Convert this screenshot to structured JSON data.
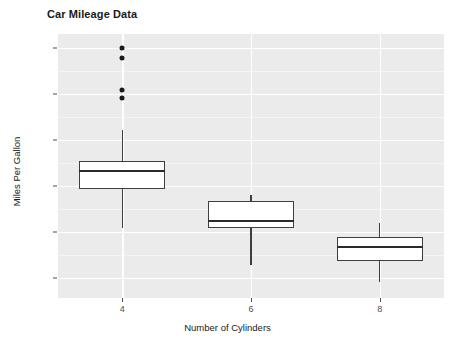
{
  "chart_data": {
    "type": "box",
    "title": "Car Mileage Data",
    "xlabel": "Number of Cylinders",
    "ylabel": "Miles Per Gallon",
    "categories": [
      "4",
      "6",
      "8"
    ],
    "x_tick_labels": [
      "4",
      "6",
      "8"
    ],
    "y_tick_labels": [
      "10",
      "15",
      "20",
      "25",
      "30",
      "35"
    ],
    "y_ticks": [
      10,
      15,
      20,
      25,
      30,
      35
    ],
    "ylim": [
      7.8,
      36.5
    ],
    "grid": true,
    "legend": "none",
    "panel_background": "#ebebeb",
    "grid_color": "#ffffff",
    "box_fill": "#ffffff",
    "box_stroke": "#3f3f3f",
    "series": [
      {
        "name": "4",
        "category": "4",
        "min_whisker": 15.4,
        "q1": 19.6,
        "median": 21.6,
        "q3": 22.7,
        "max_whisker": 26.1,
        "outliers": [
          35.0,
          33.9,
          30.4,
          29.5
        ]
      },
      {
        "name": "6",
        "category": "6",
        "min_whisker": 11.4,
        "q1": 15.4,
        "median": 16.2,
        "q3": 18.3,
        "max_whisker": 19.0,
        "outliers": []
      },
      {
        "name": "8",
        "category": "8",
        "min_whisker": 9.5,
        "q1": 11.8,
        "median": 13.3,
        "q3": 14.4,
        "max_whisker": 16.0,
        "outliers": []
      }
    ]
  }
}
